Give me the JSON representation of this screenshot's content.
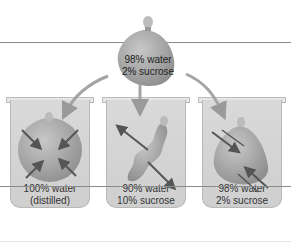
{
  "figure": {
    "top_bag": {
      "line1": "98% water",
      "line2": "2% sucrose"
    },
    "beakers": [
      {
        "name": "distilled",
        "line1": "100% water",
        "line2": "(distilled)",
        "bag_state": "swollen"
      },
      {
        "name": "hypertonic",
        "line1": "90% water",
        "line2": "10% sucrose",
        "bag_state": "shriveled"
      },
      {
        "name": "isotonic",
        "line1": "98% water",
        "line2": "2% sucrose",
        "bag_state": "unchanged"
      }
    ],
    "colors": {
      "beaker": "#d4d4d4",
      "bag": "#a9a9a9",
      "arrow": "#555555",
      "line": "#8a8a8a"
    }
  }
}
